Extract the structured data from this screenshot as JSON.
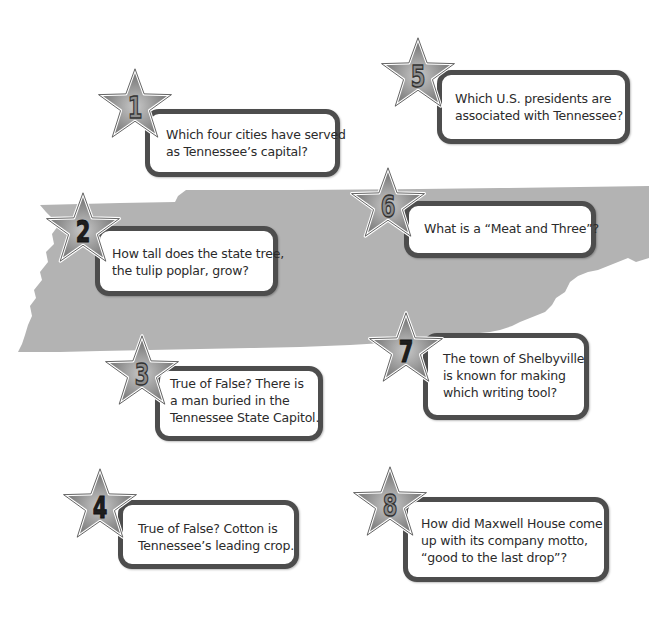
{
  "page": {
    "colors": {
      "map_fill": "#b3b3b3",
      "card_border": "#4d4d4d",
      "card_fill": "#ffffff",
      "star_fill": "#8a8a8a",
      "star_outline": "#ffffff",
      "text": "#2b2b2b"
    }
  },
  "questions": [
    {
      "number": "1",
      "text": "Which four cities have served as Tennessee’s capital?",
      "lines": [
        "Which four cities have served",
        "as Tennessee’s capital?"
      ]
    },
    {
      "number": "2",
      "text": "How tall does the state tree, the tulip poplar, grow?",
      "lines": [
        "How tall does the state tree,",
        "the tulip poplar, grow?"
      ]
    },
    {
      "number": "3",
      "text": "True of False? There is a man buried in the Tennessee State Capitol.",
      "lines": [
        "True of False? There is",
        "a man buried in the",
        "Tennessee State Capitol."
      ]
    },
    {
      "number": "4",
      "text": "True of False? Cotton is Tennessee’s leading crop.",
      "lines": [
        "True of False? Cotton is",
        "Tennessee’s leading crop."
      ]
    },
    {
      "number": "5",
      "text": "Which U.S. presidents are associated with Tennessee?",
      "lines": [
        "Which U.S. presidents are",
        "associated with Tennessee?"
      ]
    },
    {
      "number": "6",
      "text": "What is a “Meat and Three”?",
      "lines": [
        "What is a “Meat and Three”?"
      ]
    },
    {
      "number": "7",
      "text": "The town of Shelbyville is known for making which writing tool?",
      "lines": [
        "The town of Shelbyville",
        "is known for making",
        "which writing tool?"
      ]
    },
    {
      "number": "8",
      "text": "How did Maxwell House come up with its company motto, “good to the last drop”?",
      "lines": [
        "How did Maxwell House come",
        "up with its company motto,",
        "“good to the last drop”?"
      ]
    }
  ]
}
